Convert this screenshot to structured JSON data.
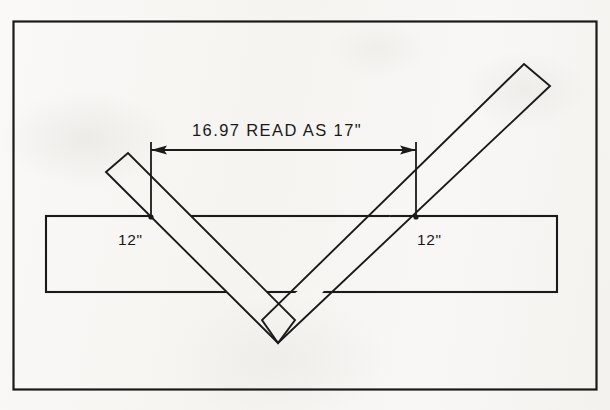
{
  "drawing": {
    "title": "V-brace across horizontal board dimension drawing",
    "background_color": "#f7f6f4",
    "ink_color": "#1a1a1a",
    "frame": {
      "x": 13,
      "y": 21,
      "width": 584,
      "height": 369
    },
    "annotations": {
      "span_dimension": {
        "label": "16.97 READ AS 17\"",
        "nominal_value": "17\"",
        "measured_value": "16.97",
        "text_x": 192,
        "text_y": 136,
        "line_y": 150,
        "from_x": 151,
        "to_x": 416,
        "arrow_style": "double-headed"
      },
      "left_leg_label": {
        "label": "12\"",
        "x": 118,
        "y": 245
      },
      "right_leg_label": {
        "label": "12\"",
        "x": 417,
        "y": 245
      }
    },
    "board": {
      "name": "horizontal board",
      "left": 46,
      "right": 557,
      "top": 216,
      "bottom": 292
    },
    "brace": {
      "name": "V-brace",
      "angle_degrees": 45,
      "thickness": 24,
      "left_leg": {
        "top_outer_x": 106,
        "top_outer_y": 172,
        "top_inner_x": 128,
        "top_inner_y": 153
      },
      "right_leg": {
        "top_outer_x": 524,
        "top_outer_y": 64,
        "top_inner_x": 550,
        "top_inner_y": 86
      },
      "apex_outer_x": 278,
      "apex_outer_y": 343,
      "apex_inner_x": 273,
      "apex_inner_y": 310
    }
  }
}
